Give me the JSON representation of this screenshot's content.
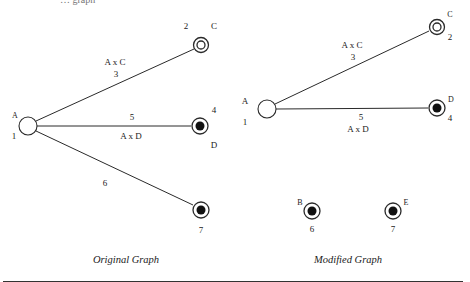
{
  "header_fragment": "… graph",
  "original_graph": {
    "caption": "Original Graph",
    "nodes": [
      {
        "id": "A",
        "label": "A",
        "number": "1",
        "type": "open",
        "x": 28,
        "y": 126
      },
      {
        "id": "C",
        "label": "C",
        "number": "2",
        "type": "double-ring",
        "x": 201,
        "y": 45
      },
      {
        "id": "D",
        "label": "D",
        "number": "4",
        "type": "filled-ring",
        "x": 200,
        "y": 126
      },
      {
        "id": "7",
        "label": "",
        "number": "7",
        "type": "filled-ring",
        "x": 201,
        "y": 210
      }
    ],
    "edges": [
      {
        "from": "A",
        "to": "C",
        "label": "A x C",
        "weight": "3"
      },
      {
        "from": "A",
        "to": "D",
        "label": "A x D",
        "weight": "5"
      },
      {
        "from": "A",
        "to": "7",
        "label": "",
        "weight": "6"
      }
    ]
  },
  "modified_graph": {
    "caption": "Modified Graph",
    "nodes": [
      {
        "id": "A",
        "label": "A",
        "number": "1",
        "type": "open",
        "x": 267,
        "y": 109
      },
      {
        "id": "C",
        "label": "C",
        "number": "2",
        "type": "double-ring",
        "x": 437,
        "y": 27
      },
      {
        "id": "D",
        "label": "D",
        "number": "4",
        "type": "filled-ring",
        "x": 437,
        "y": 108
      },
      {
        "id": "B",
        "label": "B",
        "number": "6",
        "type": "filled-ring",
        "x": 312,
        "y": 211
      },
      {
        "id": "E",
        "label": "E",
        "number": "7",
        "type": "filled-ring",
        "x": 393,
        "y": 211
      }
    ],
    "edges": [
      {
        "from": "A",
        "to": "C",
        "label": "A x C",
        "weight": "3"
      },
      {
        "from": "A",
        "to": "D",
        "label": "A x D",
        "weight": "5"
      }
    ]
  }
}
